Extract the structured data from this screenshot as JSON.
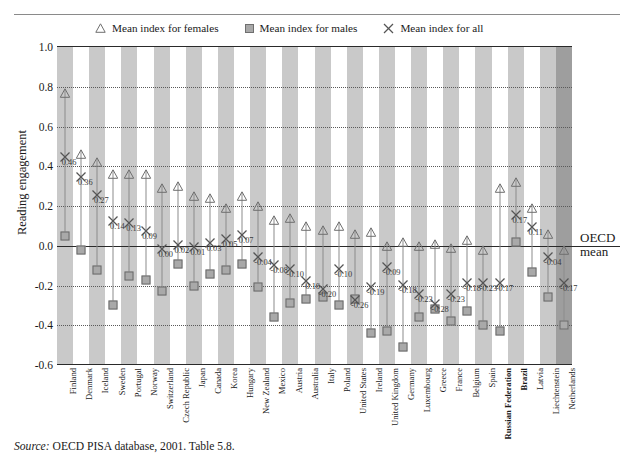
{
  "figure": {
    "cut_title": "",
    "y_axis_label": "Reading engagement",
    "oecd_mean_line1": "OECD",
    "oecd_mean_line2": "mean",
    "source_prefix": "Source:",
    "source_text": "OECD PISA database, 2001. Table 5.8."
  },
  "legend": {
    "items": [
      {
        "icon": "triangle-icon",
        "label": "Mean index for females"
      },
      {
        "icon": "square-icon",
        "label": "Mean index for males"
      },
      {
        "icon": "x-icon",
        "label": "Mean index for all"
      }
    ]
  },
  "colors": {
    "band_gray": "#c9c9c9",
    "band_white": "#ffffff",
    "band_dark": "#9e9e9e",
    "marker_fill": "#a9a9a9",
    "marker_stroke": "#6a6a6a",
    "axis": "#2a2a2a"
  },
  "chart_data": {
    "type": "scatter",
    "title": "",
    "xlabel": "",
    "ylabel": "Reading engagement",
    "ylim": [
      -0.6,
      1.0
    ],
    "yticks": [
      1.0,
      0.8,
      0.6,
      0.4,
      0.2,
      0.0,
      -0.2,
      -0.4,
      -0.6
    ],
    "ytick_labels": [
      "1.0",
      "0.8",
      "0.6",
      "0.4",
      "0.2",
      "0.0",
      "-0.2",
      "-0.4",
      "-0.6"
    ],
    "grid": true,
    "legend_position": "top",
    "reference_line": {
      "value": 0.0,
      "label": "OECD mean"
    },
    "categories": [
      "Finland",
      "Denmark",
      "Iceland",
      "Sweden",
      "Portugal",
      "Norway",
      "Switzerland",
      "Czech Republic",
      "Japan",
      "Canada",
      "Korea",
      "Hungary",
      "New Zealand",
      "Mexico",
      "Austria",
      "Australia",
      "Italy",
      "Poland",
      "United States",
      "Ireland",
      "United Kingdom",
      "Germany",
      "Luxembourg",
      "Greece",
      "France",
      "Belgium",
      "Spain",
      "Russian Federation",
      "Brazil",
      "Latvia",
      "Liechtenstein",
      "Netherlands"
    ],
    "highlight_categories": [
      "Brazil",
      "Russian Federation"
    ],
    "series": [
      {
        "name": "Mean index for females",
        "marker": "triangle",
        "values": [
          0.79,
          0.48,
          0.44,
          0.38,
          0.38,
          0.38,
          0.31,
          0.32,
          0.27,
          0.26,
          0.21,
          0.27,
          0.22,
          0.15,
          0.16,
          0.12,
          0.1,
          0.12,
          0.08,
          0.09,
          0.02,
          0.04,
          0.02,
          0.03,
          0.01,
          0.05,
          0.0,
          0.31,
          0.34,
          0.21,
          0.08,
          0.0
        ]
      },
      {
        "name": "Mean index for males",
        "marker": "square",
        "values": [
          0.05,
          -0.02,
          -0.12,
          -0.3,
          -0.15,
          -0.17,
          -0.23,
          -0.09,
          -0.2,
          -0.14,
          -0.12,
          -0.09,
          -0.21,
          -0.36,
          -0.29,
          -0.27,
          -0.26,
          -0.3,
          -0.27,
          -0.44,
          -0.43,
          -0.51,
          -0.36,
          -0.32,
          -0.38,
          -0.33,
          -0.4,
          -0.43,
          0.02,
          -0.13,
          -0.26,
          -0.4
        ]
      },
      {
        "name": "Mean index for all",
        "marker": "x",
        "values": [
          0.46,
          0.36,
          0.27,
          0.14,
          0.13,
          0.09,
          0.0,
          0.02,
          0.01,
          0.03,
          0.05,
          0.07,
          -0.04,
          -0.08,
          -0.1,
          -0.16,
          -0.2,
          -0.1,
          -0.26,
          -0.19,
          -0.09,
          -0.18,
          -0.23,
          -0.28,
          -0.23,
          -0.17,
          -0.17,
          -0.17,
          0.17,
          0.11,
          -0.04,
          -0.17
        ],
        "point_labels": [
          "0.46",
          "0.36",
          "0.27",
          "0.14",
          "0.13",
          "0.09",
          "0.00",
          "0.02",
          "0.01",
          "0.03",
          "0.05",
          "0.07",
          "-0.04",
          "-0.08",
          "-0.10",
          "-0.16",
          "-0.20",
          "-0.10",
          "-0.26",
          "-0.19",
          "-0.09",
          "-0.18",
          "-0.23",
          "-0.28",
          "-0.23",
          "-0.18",
          "-0.23",
          "-0.17",
          "0.17",
          "0.11",
          "-0.04",
          "-0.17"
        ]
      }
    ],
    "point_label_shown_for": "Mean index for all"
  }
}
